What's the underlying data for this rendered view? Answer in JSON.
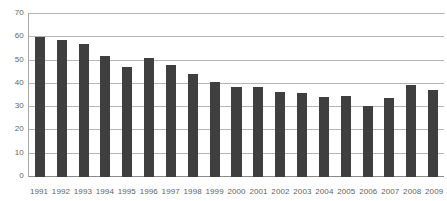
{
  "chart_data": {
    "type": "bar",
    "title": "",
    "xlabel": "",
    "ylabel": "",
    "categories": [
      "1991",
      "1992",
      "1993",
      "1994",
      "1995",
      "1996",
      "1997",
      "1998",
      "1999",
      "2000",
      "2001",
      "2002",
      "2003",
      "2004",
      "2005",
      "2006",
      "2007",
      "2008",
      "2009"
    ],
    "values": [
      60.0,
      58.7,
      57.3,
      52.0,
      47.2,
      51.2,
      48.0,
      44.2,
      41.0,
      38.5,
      38.5,
      36.7,
      36.0,
      34.2,
      34.8,
      30.5,
      34.0,
      39.4,
      37.5
    ],
    "ylim": [
      0,
      70
    ],
    "ytick_values": [
      0,
      10,
      20,
      30,
      40,
      50,
      60,
      70
    ],
    "ytick_labels": [
      "0",
      "10",
      "20",
      "30",
      "40",
      "50",
      "60",
      "70"
    ],
    "grid": true,
    "grid_axis": "y",
    "legend": false,
    "legend_position": "none",
    "bar_color": "#3f3f3f",
    "gridline_color": "#b6b6b6",
    "axis_color": "#8a8a8a",
    "tick_label_color": "#5f5f5f",
    "background_color": "#ffffff"
  }
}
